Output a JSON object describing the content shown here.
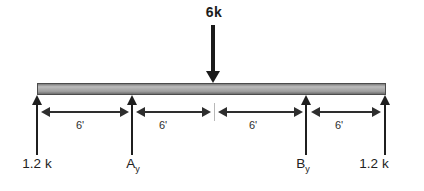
{
  "diagram": {
    "load": {
      "label": "6k"
    },
    "dimensions": [
      {
        "label": "6'"
      },
      {
        "label": "6'"
      },
      {
        "label": "6'"
      },
      {
        "label": "6'"
      }
    ],
    "reactions": {
      "left": {
        "label": "1.2 k"
      },
      "a": {
        "base": "A",
        "sub": "y"
      },
      "b": {
        "base": "B",
        "sub": "y"
      },
      "right": {
        "label": "1.2 k"
      }
    },
    "colors": {
      "arrow": "#1a1a1a",
      "beam_fill": "#a9a9a9",
      "beam_border": "#4c4c4c",
      "dim_line": "#2e2e2e",
      "text": "#222222"
    }
  }
}
